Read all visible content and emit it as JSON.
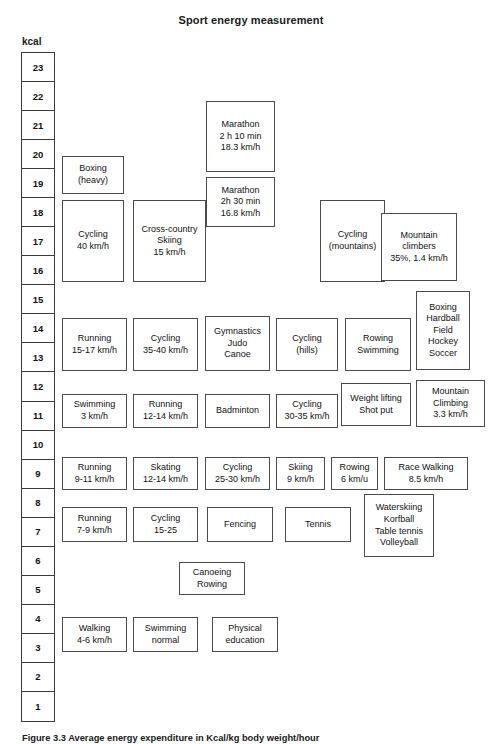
{
  "header": {
    "title": "Sport energy measurement",
    "axis_unit": "kcal"
  },
  "caption": "Figure 3.3  Average energy expenditure in Kcal/kg body weight/hour",
  "chart_data": {
    "type": "bar",
    "title": "Sport energy measurement",
    "xlabel": "",
    "ylabel": "kcal",
    "ylim": [
      1,
      23
    ],
    "grid": true,
    "legend": "none",
    "axis_ticks": [
      "23",
      "22",
      "21",
      "20",
      "19",
      "18",
      "17",
      "16",
      "15",
      "14",
      "13",
      "12",
      "11",
      "10",
      "9",
      "8",
      "7",
      "6",
      "5",
      "4",
      "3",
      "2",
      "1"
    ],
    "note": "Boxes are placed against a vertical kcal scale; each box spans the kcal range of that activity.",
    "items": [
      {
        "label": "Marathon\n2 h 10 min\n18.3 km/h",
        "lines": [
          "Marathon",
          "2 h 10 min",
          "18.3 km/h"
        ],
        "kcal_range": [
          19.6,
          22.3
        ],
        "value": 21.0,
        "x": 206,
        "y": 101,
        "w": 69,
        "h": 71
      },
      {
        "label": "Boxing\n(heavy)",
        "lines": [
          "Boxing",
          "(heavy)"
        ],
        "kcal_range": [
          18.6,
          20.1
        ],
        "value": 19.4,
        "x": 62,
        "y": 156,
        "w": 62,
        "h": 38
      },
      {
        "label": "Marathon\n2h 30 min\n16.8 km/h",
        "lines": [
          "Marathon",
          "2h 30 min",
          "16.8 km/h"
        ],
        "kcal_range": [
          17.6,
          19.4
        ],
        "value": 18.5,
        "x": 206,
        "y": 177,
        "w": 69,
        "h": 50
      },
      {
        "label": "Cycling\n40 km/h",
        "lines": [
          "Cycling",
          "40 km/h"
        ],
        "kcal_range": [
          15.6,
          18.4
        ],
        "value": 17.0,
        "x": 62,
        "y": 200,
        "w": 62,
        "h": 82
      },
      {
        "label": "Cross-country\nSkiing\n15 km/h",
        "lines": [
          "Cross-country",
          "Skiing",
          "15 km/h"
        ],
        "kcal_range": [
          15.6,
          18.4
        ],
        "value": 17.0,
        "x": 133,
        "y": 200,
        "w": 73,
        "h": 82
      },
      {
        "label": "Cycling\n(mountains)",
        "lines": [
          "Cycling",
          "(mountains)"
        ],
        "kcal_range": [
          15.6,
          18.4
        ],
        "value": 17.0,
        "x": 320,
        "y": 200,
        "w": 65,
        "h": 82
      },
      {
        "label": "Mountain\nclimbers\n35%, 1.4 km/h",
        "lines": [
          "Mountain",
          "climbers",
          "35%, 1.4 km/h"
        ],
        "kcal_range": [
          15.7,
          18.0
        ],
        "value": 16.9,
        "x": 381,
        "y": 213,
        "w": 76,
        "h": 68
      },
      {
        "label": "Boxing\nHardball\nField\nHockey\nSoccer",
        "lines": [
          "Boxing",
          "Hardball",
          "Field",
          "Hockey",
          "Soccer"
        ],
        "kcal_range": [
          12.8,
          15.2
        ],
        "value": 14.0,
        "x": 416,
        "y": 291,
        "w": 54,
        "h": 79
      },
      {
        "label": "Running\n15-17 km/h",
        "lines": [
          "Running",
          "15-17 km/h"
        ],
        "kcal_range": [
          12.8,
          14.8
        ],
        "value": 13.8,
        "x": 62,
        "y": 318,
        "w": 65,
        "h": 53
      },
      {
        "label": "Cycling\n35-40 km/h",
        "lines": [
          "Cycling",
          "35-40 km/h"
        ],
        "kcal_range": [
          12.8,
          14.8
        ],
        "value": 13.8,
        "x": 133,
        "y": 318,
        "w": 65,
        "h": 53
      },
      {
        "label": "Gymnastics\nJudo\nCanoe",
        "lines": [
          "Gymnastics",
          "Judo",
          "Canoe"
        ],
        "kcal_range": [
          12.8,
          14.8
        ],
        "value": 13.8,
        "x": 205,
        "y": 316,
        "w": 65,
        "h": 55
      },
      {
        "label": "Cycling\n(hills)",
        "lines": [
          "Cycling",
          "(hills)"
        ],
        "kcal_range": [
          12.8,
          14.8
        ],
        "value": 13.8,
        "x": 276,
        "y": 318,
        "w": 62,
        "h": 53
      },
      {
        "label": "Rowing\nSwimming",
        "lines": [
          "Rowing",
          "Swimming"
        ],
        "kcal_range": [
          12.8,
          14.8
        ],
        "value": 13.8,
        "x": 345,
        "y": 318,
        "w": 66,
        "h": 53
      },
      {
        "label": "Weight lifting\nShot put",
        "lines": [
          "Weight lifting",
          "Shot put"
        ],
        "kcal_range": [
          10.6,
          12.4
        ],
        "value": 11.5,
        "x": 341,
        "y": 383,
        "w": 70,
        "h": 43
      },
      {
        "label": "Mountain\nClimbing\n3.3 km/h",
        "lines": [
          "Mountain",
          "Climbing",
          "3.3 km/h"
        ],
        "kcal_range": [
          10.5,
          12.4
        ],
        "value": 11.5,
        "x": 416,
        "y": 380,
        "w": 69,
        "h": 47
      },
      {
        "label": "Swimming\n3 km/h",
        "lines": [
          "Swimming",
          "3 km/h"
        ],
        "kcal_range": [
          10.6,
          12.0
        ],
        "value": 11.3,
        "x": 62,
        "y": 394,
        "w": 65,
        "h": 34
      },
      {
        "label": "Running\n12-14 km/h",
        "lines": [
          "Running",
          "12-14 km/h"
        ],
        "kcal_range": [
          10.6,
          12.0
        ],
        "value": 11.3,
        "x": 133,
        "y": 394,
        "w": 65,
        "h": 34
      },
      {
        "label": "Badminton",
        "lines": [
          "Badminton"
        ],
        "kcal_range": [
          10.6,
          12.0
        ],
        "value": 11.3,
        "x": 205,
        "y": 394,
        "w": 65,
        "h": 34
      },
      {
        "label": "Cycling\n30-35 km/h",
        "lines": [
          "Cycling",
          "30-35 km/h"
        ],
        "kcal_range": [
          10.6,
          12.0
        ],
        "value": 11.3,
        "x": 276,
        "y": 394,
        "w": 62,
        "h": 34
      },
      {
        "label": "Running\n9-11 km/h",
        "lines": [
          "Running",
          "9-11 km/h"
        ],
        "kcal_range": [
          8.7,
          9.8
        ],
        "value": 9.3,
        "x": 62,
        "y": 457,
        "w": 65,
        "h": 33
      },
      {
        "label": "Skating\n12-14 km/h",
        "lines": [
          "Skating",
          "12-14 km/h"
        ],
        "kcal_range": [
          8.7,
          9.8
        ],
        "value": 9.3,
        "x": 133,
        "y": 457,
        "w": 65,
        "h": 33
      },
      {
        "label": "Cycling\n25-30 km/h",
        "lines": [
          "Cycling",
          "25-30 km/h"
        ],
        "kcal_range": [
          8.7,
          9.8
        ],
        "value": 9.3,
        "x": 205,
        "y": 457,
        "w": 65,
        "h": 33
      },
      {
        "label": "Skiing\n9 km/h",
        "lines": [
          "Skiing",
          "9 km/h"
        ],
        "kcal_range": [
          8.7,
          9.8
        ],
        "value": 9.3,
        "x": 276,
        "y": 457,
        "w": 49,
        "h": 33
      },
      {
        "label": "Rowing\n6 km/u",
        "lines": [
          "Rowing",
          "6 km/u"
        ],
        "kcal_range": [
          8.7,
          9.8
        ],
        "value": 9.3,
        "x": 331,
        "y": 457,
        "w": 47,
        "h": 33
      },
      {
        "label": "Race Walking\n8.5 km/h",
        "lines": [
          "Race Walking",
          "8.5 km/h"
        ],
        "kcal_range": [
          8.7,
          9.8
        ],
        "value": 9.3,
        "x": 384,
        "y": 457,
        "w": 84,
        "h": 33
      },
      {
        "label": "Waterskiing\nKorfball\nTable tennis\nVolleyball",
        "lines": [
          "Waterskiing",
          "Korfball",
          "Table tennis",
          "Volleyball"
        ],
        "kcal_range": [
          6.7,
          8.5
        ],
        "value": 7.6,
        "x": 364,
        "y": 494,
        "w": 70,
        "h": 63
      },
      {
        "label": "Running\n7-9 km/h",
        "lines": [
          "Running",
          "7-9 km/h"
        ],
        "kcal_range": [
          6.7,
          8.0
        ],
        "value": 7.4,
        "x": 62,
        "y": 507,
        "w": 65,
        "h": 35
      },
      {
        "label": "Cycling\n15-25",
        "lines": [
          "Cycling",
          "15-25"
        ],
        "kcal_range": [
          6.7,
          8.0
        ],
        "value": 7.4,
        "x": 133,
        "y": 507,
        "w": 65,
        "h": 35
      },
      {
        "label": "Fencing",
        "lines": [
          "Fencing"
        ],
        "kcal_range": [
          6.7,
          8.0
        ],
        "value": 7.4,
        "x": 207,
        "y": 507,
        "w": 66,
        "h": 35
      },
      {
        "label": "Tennis",
        "lines": [
          "Tennis"
        ],
        "kcal_range": [
          6.7,
          8.0
        ],
        "value": 7.4,
        "x": 285,
        "y": 507,
        "w": 66,
        "h": 35
      },
      {
        "label": "Canoeing\nRowing",
        "lines": [
          "Canoeing",
          "Rowing"
        ],
        "kcal_range": [
          4.8,
          6.0
        ],
        "value": 5.4,
        "x": 179,
        "y": 562,
        "w": 66,
        "h": 33
      },
      {
        "label": "Walking\n4-6 km/h",
        "lines": [
          "Walking",
          "4-6 km/h"
        ],
        "kcal_range": [
          2.9,
          4.1
        ],
        "value": 3.5,
        "x": 62,
        "y": 617,
        "w": 65,
        "h": 35
      },
      {
        "label": "Swimming\nnormal",
        "lines": [
          "Swimming",
          "normal"
        ],
        "kcal_range": [
          2.9,
          4.1
        ],
        "value": 3.5,
        "x": 133,
        "y": 617,
        "w": 65,
        "h": 35
      },
      {
        "label": "Physical\neducation",
        "lines": [
          "Physical",
          "education"
        ],
        "kcal_range": [
          2.9,
          4.1
        ],
        "value": 3.5,
        "x": 212,
        "y": 617,
        "w": 66,
        "h": 35
      }
    ]
  }
}
